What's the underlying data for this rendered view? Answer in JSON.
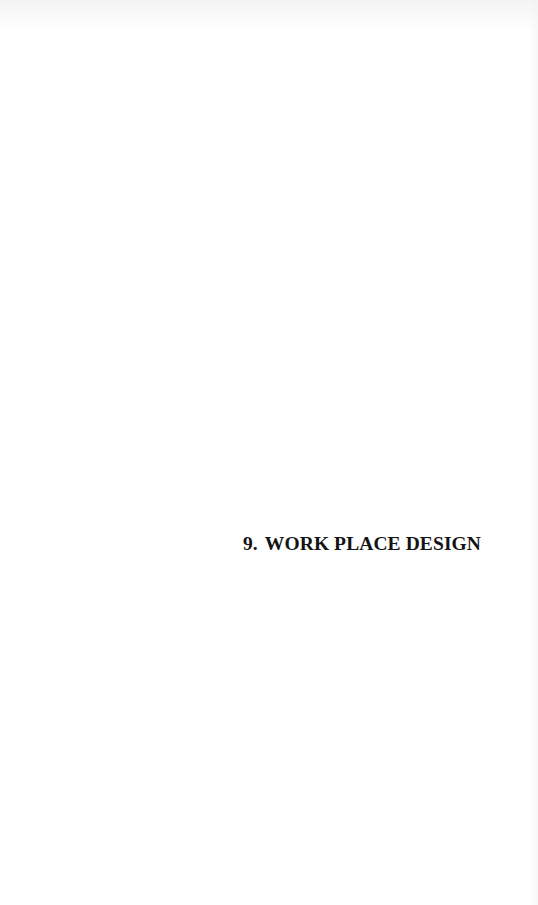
{
  "page": {
    "section_heading": {
      "number": "9.",
      "title": "WORK PLACE DESIGN"
    }
  },
  "colors": {
    "background": "#ffffff",
    "text": "#141414"
  }
}
